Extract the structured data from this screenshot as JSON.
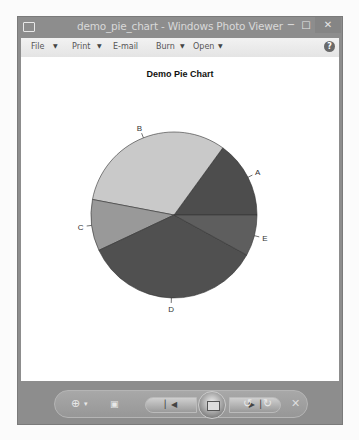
{
  "window": {
    "title": "demo_pie_chart - Windows Photo Viewer",
    "controls": {
      "minimize": "−",
      "maximize": "□",
      "close": "✕"
    }
  },
  "menubar": {
    "items": [
      {
        "label": "File",
        "has_dropdown": true
      },
      {
        "label": "Print",
        "has_dropdown": true
      },
      {
        "label": "E-mail",
        "has_dropdown": false
      },
      {
        "label": "Burn",
        "has_dropdown": true
      },
      {
        "label": "Open",
        "has_dropdown": true
      }
    ],
    "help": "?"
  },
  "toolbar": {
    "zoom_icon": "⊕",
    "zoom_caret": "▾",
    "actual_size_icon": "▣",
    "prev_icon": "▏◀",
    "next_icon": "▶▕",
    "rotate_ccw_icon": "↺",
    "rotate_cw_icon": "↻",
    "delete_icon": "✕"
  },
  "chart_data": {
    "type": "pie",
    "title": "Demo Pie Chart",
    "categories": [
      "A",
      "B",
      "C",
      "D",
      "E"
    ],
    "values": [
      15,
      32,
      10,
      35,
      8
    ],
    "colors": [
      "#4d4d4d",
      "#c9c9c9",
      "#999999",
      "#505050",
      "#5e5e5e"
    ],
    "start_angle_deg": 0,
    "direction": "counterclockwise",
    "legend": "none (labels at slice edges)"
  }
}
